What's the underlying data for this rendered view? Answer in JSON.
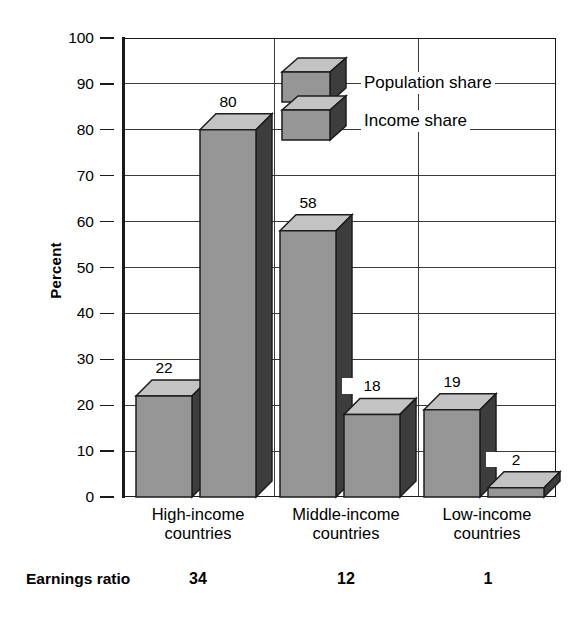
{
  "chart_data": {
    "type": "bar",
    "title": "",
    "xlabel": "",
    "ylabel": "Percent",
    "ylim": [
      0,
      100
    ],
    "yticks": [
      0,
      10,
      20,
      30,
      40,
      50,
      60,
      70,
      80,
      90,
      100
    ],
    "grid": true,
    "legend_position": "top-center",
    "categories": [
      "High-income countries",
      "Middle-income countries",
      "Low-income countries"
    ],
    "series": [
      {
        "name": "Population share",
        "values": [
          22,
          58,
          19
        ]
      },
      {
        "name": "Income share",
        "values": [
          80,
          18,
          2
        ]
      }
    ],
    "annotations": {
      "row_label": "Earnings ratio",
      "row_values": [
        "34",
        "12",
        "1"
      ]
    }
  },
  "axis": {
    "y_title": "Percent",
    "tick_labels": [
      "100",
      "90",
      "80",
      "70",
      "60",
      "50",
      "40",
      "30",
      "20",
      "10",
      "0"
    ]
  },
  "legend": {
    "items": [
      {
        "label": "Population share"
      },
      {
        "label": "Income share"
      }
    ]
  },
  "categories": [
    {
      "line1": "High-income",
      "line2": "countries"
    },
    {
      "line1": "Middle-income",
      "line2": "countries"
    },
    {
      "line1": "Low-income",
      "line2": "countries"
    }
  ],
  "bars": [
    {
      "value": "22"
    },
    {
      "value": "80"
    },
    {
      "value": "58"
    },
    {
      "value": "18"
    },
    {
      "value": "19"
    },
    {
      "value": "2"
    }
  ],
  "earnings": {
    "label": "Earnings ratio",
    "values": [
      "34",
      "12",
      "1"
    ]
  },
  "colors": {
    "bar_front": "#969696",
    "bar_side": "#3d3d3d",
    "bar_top": "#c3c3c3",
    "outline": "#1c1c1c",
    "grid": "#3a3a3a",
    "axis": "#1a1a1a"
  }
}
